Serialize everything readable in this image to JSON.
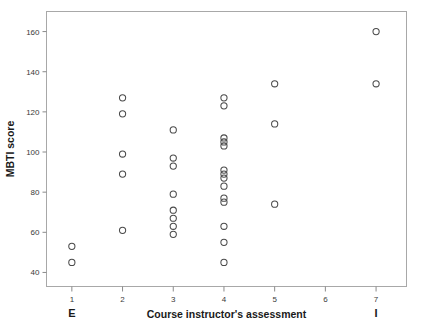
{
  "chart_data": {
    "type": "scatter",
    "title": "",
    "xlabel": "Course instructor's assessment",
    "ylabel": "MBTI score",
    "xlim": [
      0.5,
      7.6
    ],
    "ylim": [
      33,
      170
    ],
    "grid": false,
    "legend": null,
    "xticks": [
      1,
      2,
      3,
      4,
      5,
      6,
      7
    ],
    "xticklabels": [
      "1",
      "2",
      "3",
      "4",
      "5",
      "6",
      "7"
    ],
    "yticks": [
      40,
      60,
      80,
      100,
      120,
      140,
      160
    ],
    "yticklabels": [
      "40",
      "60",
      "80",
      "100",
      "120",
      "140",
      "160"
    ],
    "annotations": [
      {
        "text": "E",
        "x": 1,
        "position": "below-axis-left"
      },
      {
        "text": "I",
        "x": 7,
        "position": "below-axis-right"
      }
    ],
    "marker": {
      "shape": "open-circle",
      "radius_px": 3.1,
      "color": "#4a4a4a"
    },
    "points": [
      {
        "x": 1,
        "y": 53
      },
      {
        "x": 1,
        "y": 45
      },
      {
        "x": 2,
        "y": 127
      },
      {
        "x": 2,
        "y": 119
      },
      {
        "x": 2,
        "y": 99
      },
      {
        "x": 2,
        "y": 89
      },
      {
        "x": 2,
        "y": 61
      },
      {
        "x": 3,
        "y": 111
      },
      {
        "x": 3,
        "y": 97
      },
      {
        "x": 3,
        "y": 93
      },
      {
        "x": 3,
        "y": 79
      },
      {
        "x": 3,
        "y": 71
      },
      {
        "x": 3,
        "y": 67
      },
      {
        "x": 3,
        "y": 63
      },
      {
        "x": 3,
        "y": 59
      },
      {
        "x": 4,
        "y": 127
      },
      {
        "x": 4,
        "y": 123
      },
      {
        "x": 4,
        "y": 107
      },
      {
        "x": 4,
        "y": 105
      },
      {
        "x": 4,
        "y": 103
      },
      {
        "x": 4,
        "y": 91
      },
      {
        "x": 4,
        "y": 89
      },
      {
        "x": 4,
        "y": 87
      },
      {
        "x": 4,
        "y": 83
      },
      {
        "x": 4,
        "y": 77
      },
      {
        "x": 4,
        "y": 75
      },
      {
        "x": 4,
        "y": 63
      },
      {
        "x": 4,
        "y": 55
      },
      {
        "x": 4,
        "y": 45
      },
      {
        "x": 5,
        "y": 134
      },
      {
        "x": 5,
        "y": 114
      },
      {
        "x": 5,
        "y": 74
      },
      {
        "x": 7,
        "y": 160
      },
      {
        "x": 7,
        "y": 134
      }
    ]
  },
  "colors": {
    "marker": "#4a4a4a",
    "frame": "#a8a8a8",
    "axis": "#8a8a8a",
    "text": "#1a1a1a",
    "background": "#ffffff"
  }
}
